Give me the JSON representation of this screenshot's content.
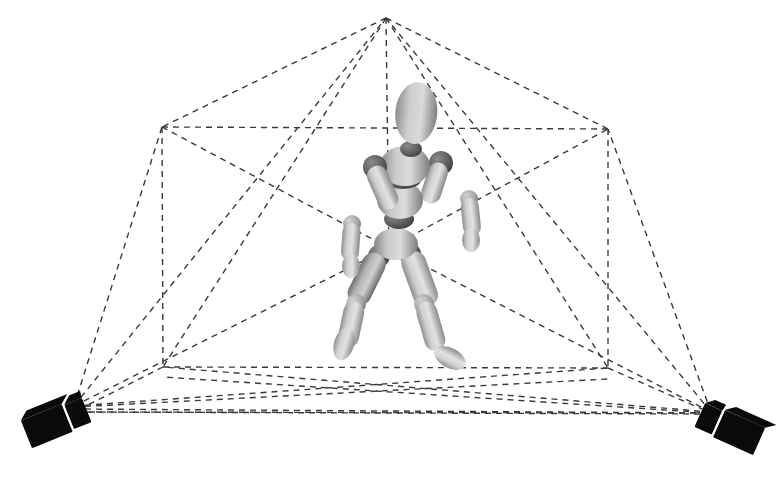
{
  "figure": {
    "background_color": "#ffffff",
    "width": 782,
    "height": 481,
    "caption": ""
  },
  "style": {
    "line_color": "#3a3a3a",
    "line_width": 1.4,
    "dash_pattern": "6,5",
    "camera_color": "#0a0a0a",
    "mannequin_light": "#d8d8d8",
    "mannequin_mid": "#b0b0b0",
    "mannequin_dark": "#6e6e6e",
    "mannequin_joint": "#555555",
    "watermark_color": "#fafafa"
  },
  "wireframe": {
    "label": "capture-volume-wireframe",
    "apex": {
      "label": "top-apex",
      "x": 386,
      "y": 18
    },
    "center": {
      "label": "volume-center",
      "x": 388,
      "y": 248
    },
    "box_corners": {
      "top_left": {
        "label": "box-top-left",
        "x": 162,
        "y": 127
      },
      "top_right": {
        "label": "box-top-right",
        "x": 608,
        "y": 129
      },
      "bottom_left": {
        "label": "box-bottom-left",
        "x": 163,
        "y": 367
      },
      "bottom_right": {
        "label": "box-bottom-right",
        "x": 608,
        "y": 368
      }
    },
    "apex_rays_count": 5,
    "ground_quad": "163,367 608,368 762,420 74,412"
  },
  "cameras": [
    {
      "id": "camera-left",
      "label": "Camera 1",
      "lens_point": {
        "x": 74,
        "y": 406
      },
      "body_x": 25,
      "body_y": 400,
      "rotation_deg": -24
    },
    {
      "id": "camera-right",
      "label": "Camera 2",
      "lens_point": {
        "x": 711,
        "y": 412
      },
      "body_x": 700,
      "body_y": 404,
      "rotation_deg": 24
    }
  ],
  "mannequin": {
    "label": "articulated-wooden-mannequin",
    "pose": "walking stride, right arm forward, left leg forward",
    "head": {
      "cx": 416,
      "cy": 115,
      "rx": 21,
      "ry": 30
    },
    "torso": {
      "cx": 401,
      "cy": 196
    },
    "joints": [
      {
        "name": "neck",
        "cx": 410,
        "cy": 148,
        "r": 9
      },
      {
        "name": "shoulder-left",
        "cx": 374,
        "cy": 166,
        "r": 11
      },
      {
        "name": "shoulder-right",
        "cx": 438,
        "cy": 162,
        "r": 11
      },
      {
        "name": "waist",
        "cx": 399,
        "cy": 218,
        "r": 12
      },
      {
        "name": "elbow-left",
        "cx": 352,
        "cy": 222,
        "r": 9
      },
      {
        "name": "elbow-right",
        "cx": 468,
        "cy": 198,
        "r": 9
      },
      {
        "name": "wrist-left",
        "cx": 350,
        "cy": 262,
        "r": 8
      },
      {
        "name": "wrist-right",
        "cx": 468,
        "cy": 236,
        "r": 8
      },
      {
        "name": "pelvis",
        "cx": 395,
        "cy": 250,
        "r": 13
      },
      {
        "name": "hip-left",
        "cx": 378,
        "cy": 256,
        "r": 10
      },
      {
        "name": "hip-right",
        "cx": 412,
        "cy": 254,
        "r": 10
      },
      {
        "name": "knee-left",
        "cx": 360,
        "cy": 300,
        "r": 9
      },
      {
        "name": "knee-right",
        "cx": 420,
        "cy": 300,
        "r": 9
      }
    ]
  },
  "watermark": {
    "text": ""
  }
}
